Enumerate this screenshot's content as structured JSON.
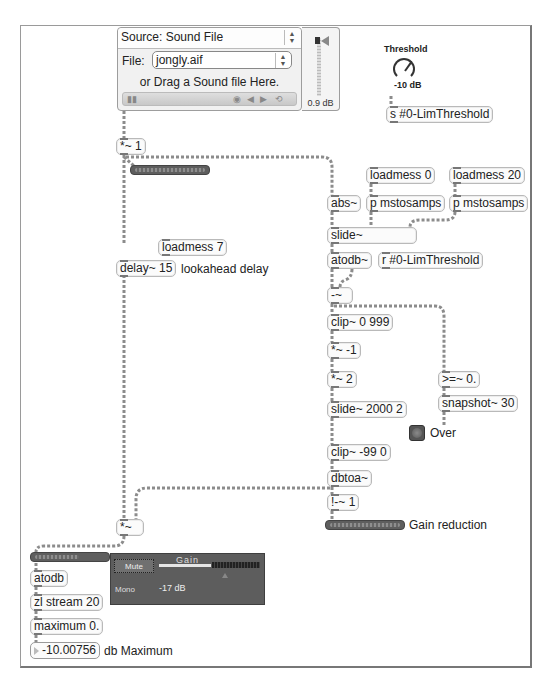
{
  "player": {
    "source_label": "Source: Sound File",
    "file_label": "File:",
    "file_value": "jongly.aif",
    "drag_hint": "or Drag a Sound file Here.",
    "transport_glyphs": "▮▮          ◉  ◀  ▶  ⟲",
    "stepper_glyph": "▲\n▼"
  },
  "output_slider": {
    "value": "0.9 dB"
  },
  "threshold_dial": {
    "title": "Threshold",
    "value": "-10 dB"
  },
  "objects": {
    "send_threshold": "s #0-LimThreshold",
    "mul_one": "*~ 1",
    "loadmess_7": "loadmess 7",
    "delay": "delay~ 15",
    "loadmess_0": "loadmess 0",
    "loadmess_20": "loadmess 20",
    "abs": "abs~",
    "mstosamps_a": "p mstosamps",
    "mstosamps_b": "p mstosamps",
    "slide": "slide~",
    "atodb_sig": "atodb~",
    "recv_threshold": "r #0-LimThreshold",
    "minus": "-~",
    "clip_0_999": "clip~ 0 999",
    "mul_neg1": "*~ -1",
    "mul_2": "*~ 2",
    "slide_2000": "slide~ 2000 2",
    "gte_0": ">=~ 0.",
    "snapshot": "snapshot~ 30",
    "clip_neg99": "clip~ -99 0",
    "dbtoa": "dbtoa~",
    "rminus_1": "!-~ 1",
    "mul_out": "*~",
    "atodb": "atodb",
    "zl_stream": "zl stream 20",
    "maximum": "maximum 0."
  },
  "comments": {
    "lookahead": "lookahead delay",
    "over": "Over",
    "gain_reduction": "Gain reduction",
    "db_maximum": "db Maximum"
  },
  "gain_panel": {
    "title": "Gain",
    "mute_label": "Mute",
    "mono_label": "Mono",
    "value": "-17 dB"
  },
  "max_number": {
    "value": "-10.00756"
  },
  "colors": {
    "patch_cord": "#8c8c8c",
    "object_border": "#b9b9b9",
    "meter_bg": "#5e5e5e",
    "gain_panel_bg": "#5d5d5d"
  }
}
